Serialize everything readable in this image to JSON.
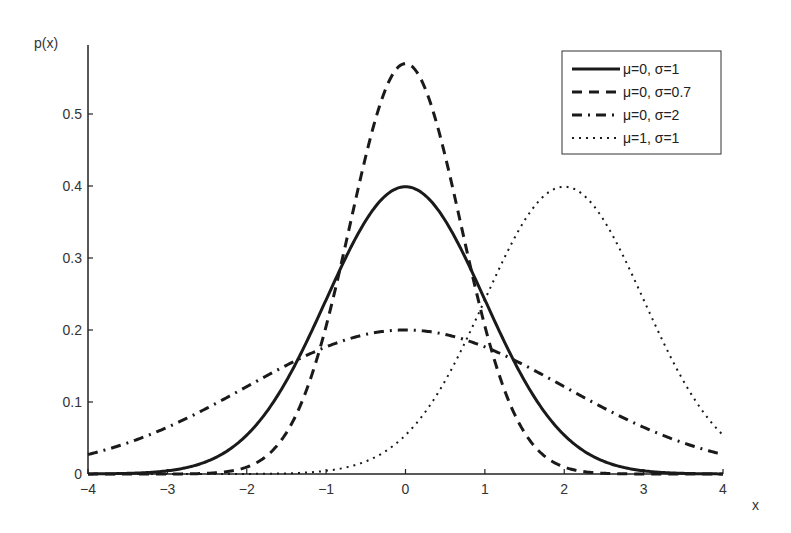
{
  "chart_data": {
    "type": "line",
    "title": "",
    "xlabel": "x",
    "ylabel": "p(x)",
    "xlim": [
      -4,
      4
    ],
    "ylim": [
      0,
      0.57
    ],
    "grid": false,
    "legend_position": "top-right",
    "x_ticks": [
      "−4",
      "−3",
      "−2",
      "−1",
      "0",
      "1",
      "2",
      "3",
      "4"
    ],
    "y_ticks": [
      "0",
      "0.1",
      "0.2",
      "0.3",
      "0.4",
      "0.5"
    ],
    "series": [
      {
        "name": "μ=0, σ=1",
        "style": "solid",
        "mu": 0,
        "sigma": 1,
        "peak": 0.399
      },
      {
        "name": "μ=0, σ=0.7",
        "style": "dashed",
        "mu": 0,
        "sigma": 0.7,
        "peak": 0.57
      },
      {
        "name": "μ=0, σ=2",
        "style": "dashdot",
        "mu": 0,
        "sigma": 2,
        "peak": 0.2
      },
      {
        "name": "μ=1, σ=1",
        "style": "dotted",
        "mu": 2,
        "sigma": 1,
        "peak": 0.399
      }
    ]
  },
  "axes": {
    "xlabel": "x",
    "ylabel": "p(x)"
  }
}
